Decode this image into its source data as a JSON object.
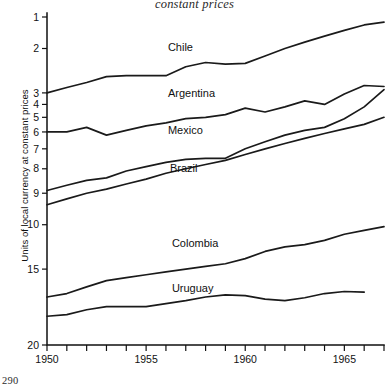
{
  "page": {
    "number": "290"
  },
  "caption": "constant prices",
  "axes": {
    "ylabel": "Units of local currency at constant prices",
    "ytick_labels": [
      "20",
      "15",
      "10",
      "9",
      "8",
      "7",
      "6",
      "5",
      "4",
      "3",
      "2",
      "1"
    ],
    "xtick_labels": [
      "1950",
      "1955",
      "1960",
      "1965"
    ]
  },
  "chart_data": {
    "type": "line",
    "title": "constant prices",
    "xlabel": "",
    "ylabel": "Units of local currency at constant prices",
    "yscale": "log",
    "ylim": [
      1,
      20
    ],
    "xlim": [
      1950,
      1967
    ],
    "grid": false,
    "legend": "inline-labels",
    "yticks": [
      1,
      2,
      3,
      4,
      5,
      6,
      7,
      8,
      9,
      10,
      15,
      20
    ],
    "xticks": [
      1950,
      1951,
      1952,
      1953,
      1954,
      1955,
      1956,
      1957,
      1958,
      1959,
      1960,
      1961,
      1962,
      1963,
      1964,
      1965,
      1966,
      1967
    ],
    "xtick_labeled": [
      1950,
      1955,
      1960,
      1965
    ],
    "x": [
      1950,
      1951,
      1952,
      1953,
      1954,
      1955,
      1956,
      1957,
      1958,
      1959,
      1960,
      1961,
      1962,
      1963,
      1964,
      1965,
      1966,
      1967
    ],
    "series": [
      {
        "name": "Chile",
        "label_x": 1956.1,
        "label_y": 14.6,
        "values": [
          10.0,
          10.5,
          11.0,
          11.6,
          11.7,
          11.7,
          11.7,
          12.7,
          13.2,
          13.0,
          13.1,
          14.0,
          15.0,
          15.9,
          16.8,
          17.7,
          18.6,
          19.1
        ]
      },
      {
        "name": "Argentina",
        "label_x": 1956.1,
        "label_y": 9.6,
        "values": [
          7.0,
          7.0,
          7.3,
          6.8,
          7.1,
          7.4,
          7.6,
          7.9,
          8.0,
          8.2,
          8.7,
          8.4,
          8.8,
          9.3,
          9.0,
          9.9,
          10.7,
          10.6
        ]
      },
      {
        "name": "Mexico",
        "label_x": 1956.1,
        "label_y": 6.85,
        "values": [
          4.1,
          4.3,
          4.5,
          4.6,
          4.9,
          5.1,
          5.3,
          5.45,
          5.5,
          5.5,
          6.0,
          6.4,
          6.8,
          7.1,
          7.3,
          7.9,
          8.8,
          10.3
        ]
      },
      {
        "name": "Brazil",
        "label_x": 1956.2,
        "label_y": 4.85,
        "values": [
          3.6,
          3.8,
          4.0,
          4.15,
          4.35,
          4.55,
          4.8,
          5.0,
          5.2,
          5.4,
          5.7,
          6.0,
          6.3,
          6.6,
          6.9,
          7.2,
          7.5,
          8.0
        ]
      },
      {
        "name": "Colombia",
        "label_x": 1956.3,
        "label_y": 2.45,
        "values": [
          1.55,
          1.6,
          1.7,
          1.8,
          1.85,
          1.9,
          1.95,
          2.0,
          2.05,
          2.1,
          2.2,
          2.35,
          2.45,
          2.5,
          2.6,
          2.75,
          2.85,
          2.95
        ]
      },
      {
        "name": "Uruguay",
        "label_x": 1956.3,
        "label_y": 1.62,
        "values": [
          1.3,
          1.32,
          1.38,
          1.42,
          1.42,
          1.42,
          1.46,
          1.5,
          1.55,
          1.58,
          1.57,
          1.52,
          1.5,
          1.54,
          1.6,
          1.63,
          1.62,
          null
        ]
      }
    ]
  }
}
